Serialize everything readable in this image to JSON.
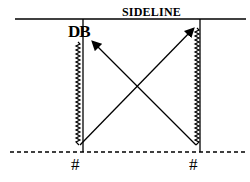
{
  "diagram": {
    "sideline_label": "SIDELINE",
    "player_label": "DB",
    "markers": [
      "#",
      "#"
    ],
    "elements": {
      "top_line": "solid sideline",
      "bottom_line": "dashed line of scrimmage",
      "verticals": [
        "left vertical line",
        "right vertical line"
      ],
      "zigzags": [
        "left zigzag route",
        "right zigzag route"
      ],
      "arrows": [
        "bottom-left to top-right",
        "bottom-right to top-left"
      ]
    },
    "colors": {
      "ink": "#000000",
      "background": "#ffffff"
    }
  }
}
